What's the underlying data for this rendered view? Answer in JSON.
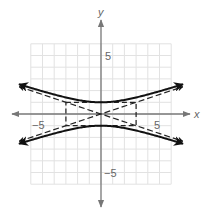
{
  "chart_data": {
    "type": "line",
    "title": "",
    "xlabel": "x",
    "ylabel": "y",
    "xlim": [
      -6,
      6
    ],
    "ylim": [
      -6,
      6
    ],
    "grid": true,
    "tick_labels": {
      "x": [
        {
          "value": -5,
          "label": "−5"
        },
        {
          "value": 5,
          "label": "5"
        }
      ],
      "y": [
        {
          "value": 5,
          "label": "5"
        },
        {
          "value": -5,
          "label": "−5"
        }
      ]
    },
    "equation": "y^2/1 - x^2/9 = 1",
    "series": [
      {
        "name": "hyperbola-upper-branch",
        "style": "solid",
        "function": "y = sqrt(1 + x^2/9)",
        "x_range": [
          -7,
          7
        ]
      },
      {
        "name": "hyperbola-lower-branch",
        "style": "solid",
        "function": "y = -sqrt(1 + x^2/9)",
        "x_range": [
          -7,
          7
        ]
      },
      {
        "name": "asymptote-positive",
        "style": "dashed",
        "function": "y = x/3",
        "x_range": [
          -7,
          7
        ]
      },
      {
        "name": "asymptote-negative",
        "style": "dashed",
        "function": "y = -x/3",
        "x_range": [
          -7,
          7
        ]
      }
    ],
    "fundamental_rectangle": {
      "style": "dashed",
      "x": [
        -3,
        3
      ],
      "y": [
        -1,
        1
      ]
    },
    "vertices": [
      [
        0,
        1
      ],
      [
        0,
        -1
      ]
    ]
  },
  "labels": {
    "x_axis": "x",
    "y_axis": "y",
    "x_neg5": "−5",
    "x_pos5": "5",
    "y_pos5": "5",
    "y_neg5": "−5"
  },
  "colors": {
    "grid": "#e2e2e2",
    "axis": "#777777",
    "curve": "#111111",
    "asymptote": "#222222",
    "label": "#666666"
  }
}
